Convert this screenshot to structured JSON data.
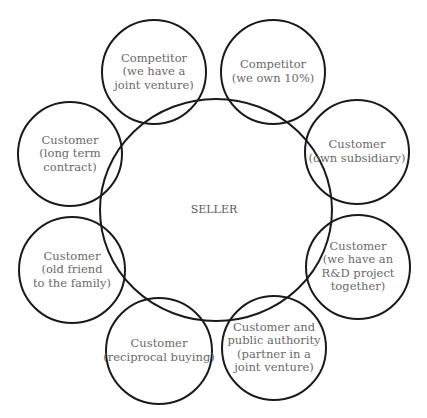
{
  "center": {
    "label": "SELLER",
    "cx": 216,
    "cy": 210,
    "rx": 116,
    "ry": 111
  },
  "nodes": [
    {
      "id": "competitor-joint-venture",
      "lines": [
        "Competitor",
        "(we have a",
        "joint venture)"
      ],
      "cx": 154,
      "cy": 72,
      "r": 52
    },
    {
      "id": "competitor-own-10",
      "lines": [
        "Competitor",
        "(we own 10%)"
      ],
      "cx": 273,
      "cy": 72,
      "r": 52
    },
    {
      "id": "customer-own-subsidiary",
      "lines": [
        "Customer",
        "(own subsidiary)"
      ],
      "cx": 357,
      "cy": 152,
      "r": 52
    },
    {
      "id": "customer-rd-project",
      "lines": [
        "Customer",
        "(we have an",
        "R&D project",
        "together)"
      ],
      "cx": 358,
      "cy": 267,
      "r": 52
    },
    {
      "id": "customer-public-authority",
      "lines": [
        "Customer and",
        "public authority",
        "(partner in a",
        "joint venture)"
      ],
      "cx": 274,
      "cy": 348,
      "r": 52
    },
    {
      "id": "customer-reciprocal-buying",
      "lines": [
        "Customer",
        "(reciprocal buying)"
      ],
      "cx": 159,
      "cy": 351,
      "r": 53
    },
    {
      "id": "customer-old-friend",
      "lines": [
        "Customer",
        "(old friend",
        "to the family)"
      ],
      "cx": 72,
      "cy": 270,
      "r": 53
    },
    {
      "id": "customer-long-term-contract",
      "lines": [
        "Customer",
        "(long term",
        "contract)"
      ],
      "cx": 70,
      "cy": 154,
      "r": 52
    }
  ],
  "colors": {
    "stroke": "#1a1a1a",
    "text": "#6a6a6a",
    "background": "#ffffff"
  }
}
